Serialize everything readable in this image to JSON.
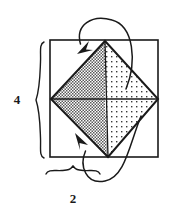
{
  "figure": {
    "type": "geometry-diagram",
    "background_color": "#ffffff",
    "line_color": "#1a1a1a",
    "outer_square": {
      "name": "outer-square",
      "x": 50,
      "y": 40,
      "width": 108,
      "height": 117,
      "fill": "#ffffff",
      "stroke": "#1a1a1a",
      "stroke_width": 1.6
    },
    "diamond": {
      "name": "inscribed-diamond",
      "vertices": [
        {
          "label": "top",
          "x": 105,
          "y": 41
        },
        {
          "label": "right",
          "x": 158,
          "y": 99
        },
        {
          "label": "bottom",
          "x": 108,
          "y": 157
        },
        {
          "label": "left",
          "x": 51,
          "y": 99
        }
      ],
      "stroke": "#1a1a1a",
      "stroke_width": 2.0
    },
    "fills": {
      "left_half": {
        "name": "diamond-left-half",
        "pattern": "dense-checker-gray",
        "pattern_color": "#555555",
        "approx_tone": "#8a8a8a",
        "description": "dark dithered gray fill on left half of diamond"
      },
      "right_half": {
        "name": "diamond-right-half",
        "pattern": "sparse-dots",
        "pattern_color": "#3a3a3a",
        "approx_tone": "#d8d8d8",
        "description": "light stippled dot fill on right half of diamond"
      }
    },
    "cross_axes": {
      "name": "diamond-diagonals",
      "horizontal": {
        "x1": 51,
        "y1": 99,
        "x2": 158,
        "y2": 99
      },
      "vertical": {
        "x1": 105,
        "y1": 41,
        "x2": 108,
        "y2": 157
      },
      "stroke": "#1a1a1a",
      "stroke_width": 1.3
    },
    "arrows": [
      {
        "name": "top-curved-arrow",
        "description": "curve looping over the top of the square from inside the right half, arrowhead pointing down-left into the upper-left region",
        "path": "M 126 89 C 136 62, 133 26, 112 20 C 92 14, 76 24, 80 43",
        "head_at": {
          "x": 83,
          "y": 51
        },
        "head_angle_deg": 225,
        "stroke": "#1a1a1a",
        "stroke_width": 1.5
      },
      {
        "name": "bottom-curved-arrow",
        "description": "curve looping under the bottom of the square from the lower-right, arrowhead pointing up-left into the dark shaded lower-left region",
        "path": "M 140 118 C 128 146, 124 176, 104 180 C 86 184, 80 166, 86 150",
        "head_at": {
          "x": 80,
          "y": 137
        },
        "head_angle_deg": 215,
        "stroke": "#1a1a1a",
        "stroke_width": 1.5
      }
    ],
    "braces": [
      {
        "name": "height-brace",
        "orientation": "vertical",
        "label": "4",
        "label_position": {
          "x": 17,
          "y": 103
        },
        "span_start": {
          "x": 42,
          "y": 42
        },
        "span_end": {
          "x": 42,
          "y": 159
        },
        "stroke": "#1a1a1a",
        "stroke_width": 1.3
      },
      {
        "name": "width-brace",
        "orientation": "horizontal",
        "label": "2",
        "label_position": {
          "x": 72,
          "y": 203
        },
        "span_start": {
          "x": 46,
          "y": 172
        },
        "span_end": {
          "x": 100,
          "y": 172
        },
        "stroke": "#1a1a1a",
        "stroke_width": 1.3
      }
    ],
    "labels": {
      "height": "4",
      "width": "2"
    }
  }
}
